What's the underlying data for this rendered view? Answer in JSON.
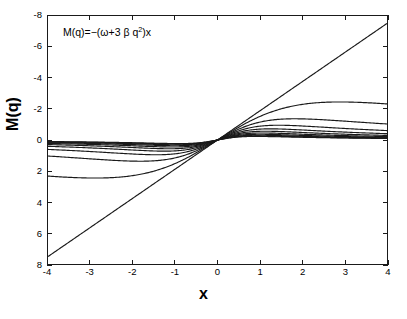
{
  "figure": {
    "annotation": "M(q)=−(ω+3 β q",
    "annotation_sup": "2",
    "annotation_tail": ")x",
    "background": "#ffffff",
    "line_color": "#1a1a1a"
  },
  "axes": {
    "x_title": "x",
    "y_title": "M(q)",
    "x_ticks": [
      "-4",
      "-3",
      "-2",
      "-1",
      "0",
      "1",
      "2",
      "3",
      "4"
    ],
    "y_ticks": [
      "8",
      "6",
      "4",
      "2",
      "0",
      "-2",
      "-4",
      "-6",
      "-8"
    ]
  },
  "chart_data": {
    "type": "line",
    "title": "",
    "annotation": "M(q)=−(ω+3 β q²)x",
    "xlabel": "x",
    "ylabel": "M(q)",
    "xlim": [
      -4,
      4
    ],
    "ylim": [
      -8,
      8
    ],
    "xticks": [
      -4,
      -3,
      -2,
      -1,
      0,
      1,
      2,
      3,
      4
    ],
    "yticks": [
      -8,
      -6,
      -4,
      -2,
      0,
      2,
      4,
      6,
      8
    ],
    "grid": false,
    "legend": false,
    "x": [
      -4,
      -3.5,
      -3,
      -2.5,
      -2,
      -1.5,
      -1,
      -0.5,
      0,
      0.5,
      1,
      1.5,
      2,
      2.5,
      3,
      3.5,
      4
    ],
    "series": [
      {
        "name": "curve-1",
        "slope_coeff": 1.88,
        "saturation": 0.0,
        "values": [
          -7.5,
          -6.56,
          -5.63,
          -4.69,
          -3.75,
          -2.81,
          -1.88,
          -0.94,
          0,
          0.94,
          1.88,
          2.81,
          3.75,
          4.69,
          5.63,
          6.56,
          7.5
        ]
      },
      {
        "name": "curve-2",
        "slope_coeff": 1.7,
        "saturation": 0.12,
        "values": [
          -5.6,
          -5.0,
          -4.37,
          -3.7,
          -3.0,
          -2.28,
          -1.54,
          -0.78,
          0,
          0.78,
          1.54,
          2.28,
          3.0,
          3.7,
          4.37,
          5.0,
          5.6
        ]
      },
      {
        "name": "curve-3",
        "slope_coeff": 1.5,
        "saturation": 0.3,
        "values": [
          -3.85,
          -3.56,
          -3.2,
          -2.79,
          -2.33,
          -1.82,
          -1.26,
          -0.65,
          0,
          0.65,
          1.26,
          1.82,
          2.33,
          2.79,
          3.2,
          3.56,
          3.85
        ]
      },
      {
        "name": "curve-4",
        "slope_coeff": 1.32,
        "saturation": 0.48,
        "values": [
          -2.35,
          -2.3,
          -2.2,
          -2.02,
          -1.77,
          -1.44,
          -1.04,
          -0.55,
          0,
          0.55,
          1.04,
          1.44,
          1.77,
          2.02,
          2.2,
          2.3,
          2.35
        ]
      },
      {
        "name": "curve-5",
        "slope_coeff": 1.15,
        "saturation": 0.64,
        "values": [
          -1.02,
          -1.1,
          -1.15,
          -1.15,
          -1.1,
          -0.97,
          -0.76,
          -0.43,
          0,
          0.43,
          0.76,
          0.97,
          1.1,
          1.15,
          1.15,
          1.1,
          1.02
        ]
      },
      {
        "name": "curve-6",
        "slope_coeff": 1.0,
        "saturation": 0.78,
        "values": [
          -0.08,
          -0.23,
          -0.38,
          -0.5,
          -0.58,
          -0.6,
          -0.53,
          -0.33,
          0,
          0.33,
          0.53,
          0.6,
          0.58,
          0.5,
          0.38,
          0.23,
          0.08
        ]
      },
      {
        "name": "curve-7",
        "slope_coeff": 0.86,
        "saturation": 0.9,
        "values": [
          0.92,
          0.6,
          0.3,
          0.05,
          -0.14,
          -0.26,
          -0.3,
          -0.22,
          0,
          0.22,
          0.3,
          0.26,
          0.14,
          -0.05,
          -0.3,
          -0.6,
          -0.92
        ]
      },
      {
        "name": "curve-8",
        "slope_coeff": 0.74,
        "saturation": 1.0,
        "values": [
          1.72,
          1.28,
          0.86,
          0.48,
          0.17,
          -0.05,
          -0.15,
          -0.13,
          0,
          0.13,
          0.15,
          0.05,
          -0.17,
          -0.48,
          -0.86,
          -1.28,
          -1.72
        ]
      },
      {
        "name": "curve-9",
        "slope_coeff": 0.64,
        "saturation": 1.08,
        "values": [
          2.2,
          1.7,
          1.22,
          0.76,
          0.38,
          0.09,
          -0.06,
          -0.07,
          0,
          0.07,
          0.06,
          -0.09,
          -0.38,
          -0.76,
          -1.22,
          -1.7,
          -2.2
        ]
      },
      {
        "name": "curve-10",
        "slope_coeff": 0.56,
        "saturation": 1.14,
        "values": [
          2.42,
          1.9,
          1.4,
          0.92,
          0.5,
          0.17,
          -0.02,
          -0.05,
          0,
          0.05,
          0.02,
          -0.17,
          -0.5,
          -0.92,
          -1.4,
          -1.9,
          -2.42
        ]
      },
      {
        "name": "curve-11",
        "slope_coeff": 0.5,
        "saturation": 1.18,
        "values": [
          2.55,
          2.02,
          1.5,
          1.0,
          0.57,
          0.22,
          0.01,
          -0.03,
          0,
          0.03,
          -0.01,
          -0.22,
          -0.57,
          -1.0,
          -1.5,
          -2.02,
          -2.55
        ]
      }
    ]
  }
}
